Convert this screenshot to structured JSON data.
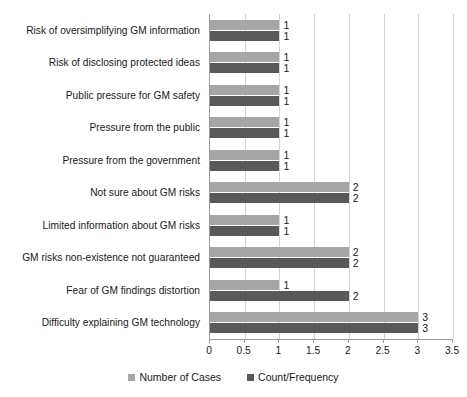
{
  "chart_data": {
    "type": "bar",
    "orientation": "horizontal",
    "title": "",
    "xlabel": "",
    "ylabel": "",
    "xlim": [
      0,
      3.5
    ],
    "xticks": [
      "0",
      "0.5",
      "1",
      "1.5",
      "2",
      "2.5",
      "3",
      "3.5"
    ],
    "xtick_values": [
      0,
      0.5,
      1,
      1.5,
      2,
      2.5,
      3,
      3.5
    ],
    "grid": true,
    "legend_position": "bottom",
    "categories": [
      "Risk of oversimplifying GM information",
      "Risk of disclosing protected ideas",
      "Public pressure for GM safety",
      "Pressure from the public",
      "Pressure from the government",
      "Not sure about GM risks",
      "Limited information about GM risks",
      "GM risks non-existence not guaranteed",
      "Fear of GM findings distortion",
      "Difficulty explaining GM technology"
    ],
    "series": [
      {
        "name": "Number of Cases",
        "color": "#a6a6a6",
        "values": [
          1,
          1,
          1,
          1,
          1,
          2,
          1,
          2,
          1,
          3
        ],
        "labels": [
          "1",
          "1",
          "1",
          "1",
          "1",
          "2",
          "1",
          "2",
          "1",
          "3"
        ]
      },
      {
        "name": "Count/Frequency",
        "color": "#595959",
        "values": [
          1,
          1,
          1,
          1,
          1,
          2,
          1,
          2,
          2,
          3
        ],
        "labels": [
          "1",
          "1",
          "1",
          "1",
          "1",
          "2",
          "1",
          "2",
          "2",
          "3"
        ]
      }
    ]
  },
  "legend": {
    "items": [
      {
        "label": "Number of Cases",
        "color": "#a6a6a6"
      },
      {
        "label": "Count/Frequency",
        "color": "#595959"
      }
    ]
  },
  "colors": {
    "series_light": "#a6a6a6",
    "series_dark": "#595959",
    "gridline": "#d3d3d3",
    "axis": "#9b9b9b",
    "text": "#1a1a1a",
    "background": "#ffffff"
  }
}
